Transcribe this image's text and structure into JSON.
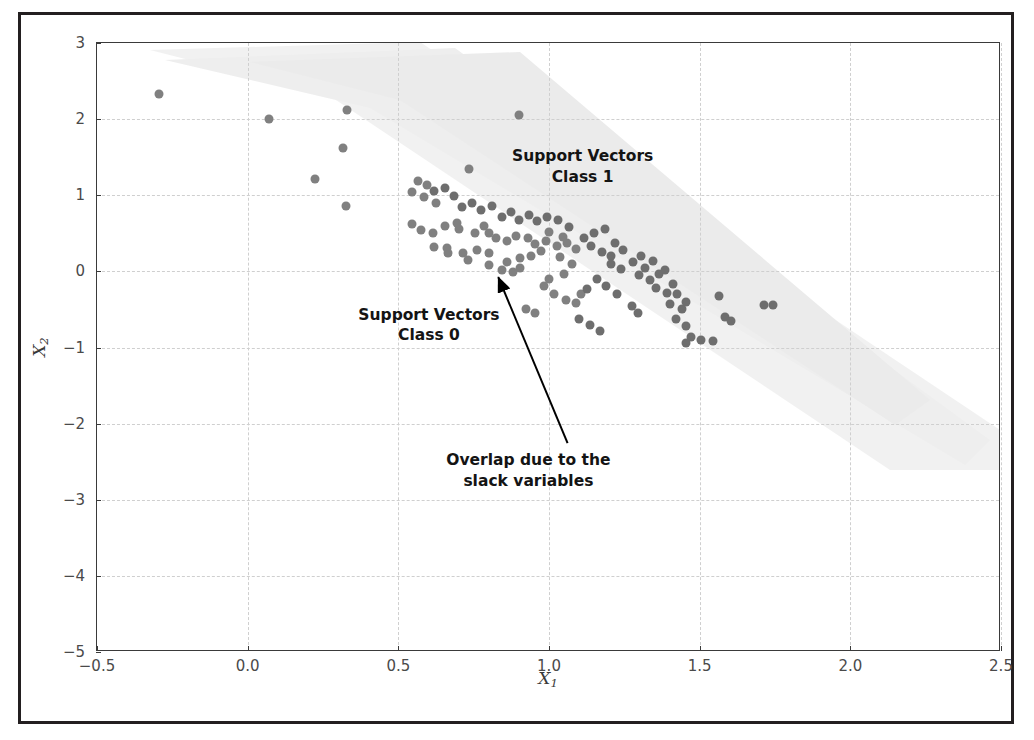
{
  "figure": {
    "kind": "scatter-plot",
    "background": "#ffffff",
    "frame_color": "#231f20",
    "axis_color": "#3a3a3a",
    "grid_color": "#cfcfcf"
  },
  "chart_data": {
    "type": "scatter",
    "title": "",
    "xlabel": "X_1",
    "ylabel": "X_2",
    "xlim": [
      -0.5,
      2.5
    ],
    "ylim": [
      -5,
      3
    ],
    "grid": true,
    "grid_style": "dashed",
    "legend": "none",
    "xticks": [
      -0.5,
      0.0,
      0.5,
      1.0,
      1.5,
      2.0,
      2.5
    ],
    "xticklabels": [
      "-0.5",
      "0.0",
      "0.5",
      "1.0",
      "1.5",
      "2.0",
      "2.5"
    ],
    "yticks": [
      -5,
      -4,
      -3,
      -2,
      -1,
      0,
      1,
      2,
      3
    ],
    "yticklabels": [
      "-5",
      "-4",
      "-3",
      "-2",
      "-1",
      "0",
      "1",
      "2",
      "3"
    ],
    "annotations": [
      {
        "name": "support-vectors-class-1",
        "text": "Support Vectors\nClass 1",
        "x": 1.115,
        "y": 1.47
      },
      {
        "name": "support-vectors-class-0",
        "text": "Support Vectors\nClass 0",
        "x": 0.605,
        "y": -0.61
      },
      {
        "name": "overlap-slack-variables",
        "text": "Overlap due to the\nslack variables",
        "x": 0.935,
        "y": -2.52
      }
    ],
    "arrow": {
      "name": "overlap-arrow",
      "tail_x": 1.065,
      "tail_y": -2.27,
      "head_x": 0.835,
      "head_y": -0.09,
      "color": "#000000"
    },
    "shaded_band": {
      "name": "decision-region-band",
      "color": "#ebebeb",
      "opacity": 0.75,
      "description": "faint diagonal margin band running from upper-left to lower-right"
    },
    "series": [
      {
        "name": "class-0",
        "color": "#808080",
        "marker": "o",
        "size": 9,
        "points": [
          [
            0.07,
            2.0
          ],
          [
            0.33,
            2.12
          ],
          [
            0.225,
            1.22
          ],
          [
            0.315,
            1.62
          ],
          [
            0.325,
            0.86
          ],
          [
            0.565,
            1.19
          ],
          [
            0.595,
            1.13
          ],
          [
            0.545,
            1.04
          ],
          [
            0.585,
            0.98
          ],
          [
            0.625,
            0.9
          ],
          [
            0.545,
            0.62
          ],
          [
            0.575,
            0.545
          ],
          [
            0.615,
            0.5
          ],
          [
            0.655,
            0.6
          ],
          [
            0.7,
            0.56
          ],
          [
            0.735,
            1.345
          ],
          [
            0.695,
            0.64
          ],
          [
            0.755,
            0.505
          ],
          [
            0.785,
            0.6
          ],
          [
            0.8,
            0.51
          ],
          [
            0.825,
            0.44
          ],
          [
            0.76,
            0.275
          ],
          [
            0.8,
            0.245
          ],
          [
            0.86,
            0.4
          ],
          [
            0.89,
            0.47
          ],
          [
            0.86,
            0.12
          ],
          [
            0.905,
            0.17
          ],
          [
            0.93,
            0.44
          ],
          [
            0.955,
            0.36
          ],
          [
            0.62,
            0.32
          ],
          [
            0.66,
            0.31
          ],
          [
            0.665,
            0.245
          ],
          [
            0.715,
            0.245
          ],
          [
            0.73,
            0.145
          ],
          [
            0.8,
            0.08
          ],
          [
            0.845,
            0.02
          ],
          [
            0.88,
            -0.01
          ],
          [
            0.905,
            0.04
          ],
          [
            0.94,
            0.2
          ],
          [
            0.975,
            0.27
          ],
          [
            1.0,
            0.52
          ],
          [
            0.99,
            0.4
          ],
          [
            1.025,
            0.33
          ],
          [
            1.045,
            0.455
          ],
          [
            1.06,
            0.37
          ],
          [
            1.09,
            0.3
          ],
          [
            1.035,
            0.185
          ],
          [
            1.075,
            0.1
          ],
          [
            1.05,
            -0.04
          ],
          [
            1.0,
            -0.1
          ],
          [
            0.985,
            -0.19
          ],
          [
            1.015,
            -0.3
          ],
          [
            1.055,
            -0.375
          ],
          [
            1.09,
            -0.42
          ],
          [
            1.105,
            -0.295
          ],
          [
            0.925,
            -0.5
          ],
          [
            0.955,
            -0.55
          ],
          [
            0.9,
            2.05
          ],
          [
            -0.295,
            2.33
          ]
        ]
      },
      {
        "name": "class-1",
        "color": "#6e6e6e",
        "marker": "o",
        "size": 9,
        "points": [
          [
            1.115,
            0.44
          ],
          [
            1.15,
            0.5
          ],
          [
            1.185,
            0.56
          ],
          [
            1.14,
            0.33
          ],
          [
            1.175,
            0.25
          ],
          [
            1.205,
            0.2
          ],
          [
            1.22,
            0.37
          ],
          [
            1.245,
            0.28
          ],
          [
            1.205,
            0.1
          ],
          [
            1.24,
            0.03
          ],
          [
            1.28,
            0.12
          ],
          [
            1.305,
            0.2
          ],
          [
            1.32,
            0.05
          ],
          [
            1.345,
            0.14
          ],
          [
            1.3,
            -0.05
          ],
          [
            1.335,
            -0.11
          ],
          [
            1.365,
            -0.04
          ],
          [
            1.385,
            0.02
          ],
          [
            1.355,
            -0.22
          ],
          [
            1.39,
            -0.28
          ],
          [
            1.41,
            -0.16
          ],
          [
            1.425,
            -0.3
          ],
          [
            1.4,
            -0.43
          ],
          [
            1.44,
            -0.5
          ],
          [
            1.455,
            -0.4
          ],
          [
            1.42,
            -0.62
          ],
          [
            1.455,
            -0.72
          ],
          [
            1.47,
            -0.86
          ],
          [
            1.455,
            -0.94
          ],
          [
            1.505,
            -0.9
          ],
          [
            1.545,
            -0.92
          ],
          [
            1.565,
            -0.33
          ],
          [
            1.585,
            -0.6
          ],
          [
            1.605,
            -0.65
          ],
          [
            1.715,
            -0.44
          ],
          [
            1.745,
            -0.44
          ],
          [
            1.275,
            -0.45
          ],
          [
            1.295,
            -0.55
          ],
          [
            1.225,
            -0.3
          ],
          [
            1.19,
            -0.19
          ],
          [
            1.16,
            -0.1
          ],
          [
            1.125,
            -0.23
          ],
          [
            1.1,
            -0.62
          ],
          [
            1.135,
            -0.7
          ],
          [
            1.17,
            -0.78
          ],
          [
            1.065,
            0.58
          ],
          [
            1.03,
            0.67
          ],
          [
            0.995,
            0.72
          ],
          [
            0.96,
            0.665
          ],
          [
            0.935,
            0.74
          ],
          [
            0.9,
            0.68
          ],
          [
            0.875,
            0.78
          ],
          [
            0.845,
            0.72
          ],
          [
            0.81,
            0.86
          ],
          [
            0.775,
            0.8
          ],
          [
            0.745,
            0.9
          ],
          [
            0.71,
            0.84
          ],
          [
            0.685,
            0.99
          ],
          [
            0.655,
            1.1
          ],
          [
            0.62,
            1.06
          ]
        ]
      }
    ]
  }
}
